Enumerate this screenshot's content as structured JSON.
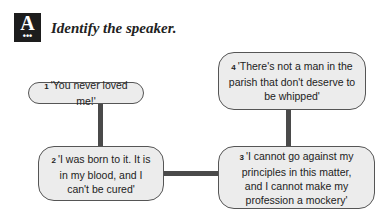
{
  "header": {
    "badge_letter": "A",
    "badge_dots": "•••",
    "instruction": "Identify the speaker."
  },
  "quotes": [
    {
      "number": "1",
      "text": "'You never loved me!'"
    },
    {
      "number": "2",
      "text": "'I was born to it. It is in my blood, and I can't be cured'"
    },
    {
      "number": "3",
      "text": "'I cannot go against my principles in this matter, and I cannot make my profession a mockery'"
    },
    {
      "number": "4",
      "text": "'There's not a man in the parish that don't deserve to be whipped'"
    }
  ]
}
